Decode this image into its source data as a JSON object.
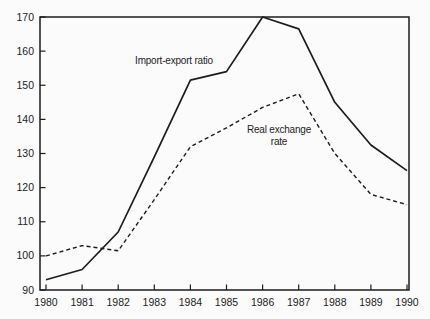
{
  "figure": {
    "background": "#fbfbfb",
    "line_color": "#1c1c1c",
    "text_color": "#1c1c1c"
  },
  "chart_data": {
    "type": "line",
    "title": "",
    "xlabel": "",
    "ylabel": "",
    "categories": [
      1980,
      1981,
      1982,
      1983,
      1984,
      1985,
      1986,
      1987,
      1988,
      1989,
      1990
    ],
    "x_tick_labels": [
      "1980",
      "1981",
      "1982",
      "1983",
      "1984",
      "1985",
      "1986",
      "1987",
      "1988",
      "1989",
      "1990"
    ],
    "y_ticks": [
      90,
      100,
      110,
      120,
      130,
      140,
      150,
      160,
      170
    ],
    "y_tick_labels": [
      "90",
      "100",
      "110",
      "120",
      "130",
      "140",
      "150",
      "160",
      "170"
    ],
    "ylim": [
      90,
      170
    ],
    "xlim": [
      1980,
      1990
    ],
    "grid": false,
    "frame": "full-box",
    "tick_direction": "in",
    "legend_position": "inline-annotations",
    "series": [
      {
        "name": "Import-export ratio",
        "line_style": "solid",
        "color": "#1c1c1c",
        "values": [
          93,
          96,
          107,
          129,
          151.5,
          154,
          170,
          166.5,
          145,
          132.5,
          125
        ]
      },
      {
        "name": "Real exchange rate",
        "line_style": "dashed",
        "color": "#1c1c1c",
        "values": [
          100,
          103,
          101.5,
          116.5,
          132,
          137.5,
          143.5,
          147.5,
          130,
          118,
          115
        ]
      }
    ],
    "annotations": [
      {
        "text": "Import-export ratio",
        "x": 174,
        "y": 61,
        "for_series": "Import-export ratio"
      },
      {
        "text": "Real exchange\nrate",
        "x": 279,
        "y": 136,
        "for_series": "Real exchange rate"
      }
    ]
  }
}
